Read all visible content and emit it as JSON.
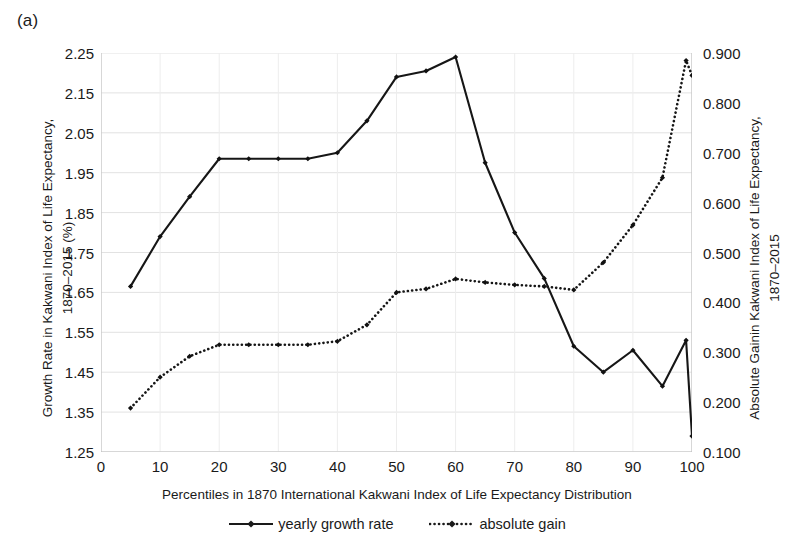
{
  "panel": {
    "label": "(a)"
  },
  "axes": {
    "left_title": "Growth Rate in Kakwani Index of Life Expectancy,\n1870–2015 (%)",
    "right_title": "Absolute Gainin Kakwani Index of Life Expectancy,\n1870–2015",
    "x_title": "Percentiles in 1870 International Kakwani Index of Life Expectancy Distribution"
  },
  "legend": {
    "items": [
      {
        "label": "yearly growth rate",
        "style": "solid-line-with-marker",
        "color": "#1a1a1a"
      },
      {
        "label": "absolute gain",
        "style": "dotted-line-with-marker",
        "color": "#1a1a1a"
      }
    ]
  },
  "chart_data": {
    "type": "line",
    "title": "(a)",
    "xlabel": "Percentiles in 1870 International Kakwani Index of Life Expectancy Distribution",
    "ylabel": "Growth Rate in Kakwani Index of Life Expectancy, 1870–2015 (%)",
    "y2label": "Absolute Gainin Kakwani Index of Life Expectancy, 1870–2015",
    "xlim": [
      0,
      100
    ],
    "ylim": [
      1.25,
      2.25
    ],
    "y2lim": [
      0.1,
      0.9
    ],
    "xticks": [
      0,
      10,
      20,
      30,
      40,
      50,
      60,
      70,
      80,
      90,
      100
    ],
    "yticks": [
      "1.25",
      "1.35",
      "1.45",
      "1.55",
      "1.65",
      "1.75",
      "1.85",
      "1.95",
      "2.05",
      "2.15",
      "2.25"
    ],
    "y2ticks": [
      "0.100",
      "0.200",
      "0.300",
      "0.400",
      "0.500",
      "0.600",
      "0.700",
      "0.800",
      "0.900"
    ],
    "grid": true,
    "legend_position": "bottom",
    "x": [
      5,
      10,
      15,
      20,
      25,
      30,
      35,
      40,
      45,
      50,
      55,
      60,
      65,
      70,
      75,
      80,
      85,
      90,
      95,
      99,
      100
    ],
    "series": [
      {
        "name": "yearly growth rate",
        "axis": "left",
        "marker": "filled-diamond",
        "linestyle": "solid",
        "values": [
          1.665,
          1.79,
          1.89,
          1.985,
          1.985,
          1.985,
          1.985,
          2.0,
          2.08,
          2.19,
          2.205,
          2.24,
          1.975,
          1.8,
          1.685,
          1.515,
          1.45,
          1.505,
          1.415,
          1.53,
          1.29
        ]
      },
      {
        "name": "absolute gain",
        "axis": "right",
        "marker": "filled-diamond",
        "linestyle": "dotted",
        "values": [
          0.188,
          0.25,
          0.292,
          0.315,
          0.315,
          0.315,
          0.315,
          0.322,
          0.355,
          0.42,
          0.427,
          0.447,
          0.44,
          0.435,
          0.432,
          0.425,
          0.48,
          0.555,
          0.65,
          0.885,
          0.855
        ]
      }
    ]
  }
}
